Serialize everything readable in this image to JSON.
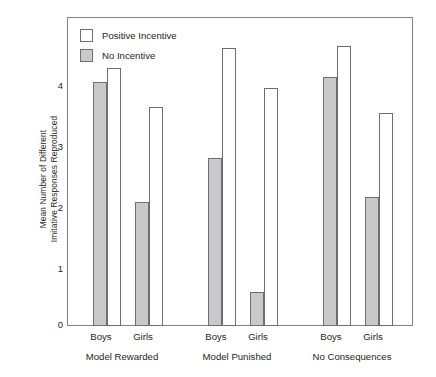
{
  "chart_data": {
    "type": "bar",
    "title": "",
    "subtitle": "",
    "xlabel": "",
    "ylabel_lines": [
      "Mean Number of Different",
      "Imitative Responses Reproduced"
    ],
    "ylabel": "Mean Number of Different Imitative Responses Reproduced",
    "ylim": [
      0,
      4.55
    ],
    "yticks": [
      0,
      1,
      2,
      3,
      4
    ],
    "ytick_labels": [
      "0",
      "1",
      "2",
      "3",
      "4"
    ],
    "grid": false,
    "legend_position": "top-left",
    "legend": [
      {
        "name": "Positive Incentive",
        "swatch": "hollow",
        "color": "#ffffff"
      },
      {
        "name": "No Incentive",
        "swatch": "filled",
        "color": "#c9c9c9"
      }
    ],
    "groups": [
      "Model Rewarded",
      "Model Punished",
      "No Consequences"
    ],
    "subgroups": [
      "Boys",
      "Girls"
    ],
    "categories": [
      "Model Rewarded / Boys",
      "Model Rewarded / Girls",
      "Model Punished / Boys",
      "Model Punished / Girls",
      "No Consequences / Boys",
      "No Consequences / Girls"
    ],
    "series": [
      {
        "name": "No Incentive",
        "swatch": "filled",
        "values": [
          3.6,
          1.83,
          2.48,
          0.5,
          3.66,
          1.9
        ]
      },
      {
        "name": "Positive Incentive",
        "swatch": "hollow",
        "values": [
          3.8,
          3.22,
          4.1,
          3.5,
          4.12,
          3.13
        ]
      }
    ],
    "bars": [
      {
        "group": "Model Rewarded",
        "subgroup": "Boys",
        "series": "No Incentive",
        "value": 3.6,
        "style": "filled"
      },
      {
        "group": "Model Rewarded",
        "subgroup": "Boys",
        "series": "Positive Incentive",
        "value": 3.8,
        "style": "hollow"
      },
      {
        "group": "Model Rewarded",
        "subgroup": "Girls",
        "series": "No Incentive",
        "value": 1.83,
        "style": "filled"
      },
      {
        "group": "Model Rewarded",
        "subgroup": "Girls",
        "series": "Positive Incentive",
        "value": 3.22,
        "style": "hollow"
      },
      {
        "group": "Model Punished",
        "subgroup": "Boys",
        "series": "No Incentive",
        "value": 2.48,
        "style": "filled"
      },
      {
        "group": "Model Punished",
        "subgroup": "Boys",
        "series": "Positive Incentive",
        "value": 4.1,
        "style": "hollow"
      },
      {
        "group": "Model Punished",
        "subgroup": "Girls",
        "series": "No Incentive",
        "value": 0.5,
        "style": "filled"
      },
      {
        "group": "Model Punished",
        "subgroup": "Girls",
        "series": "Positive Incentive",
        "value": 3.5,
        "style": "hollow"
      },
      {
        "group": "No Consequences",
        "subgroup": "Boys",
        "series": "No Incentive",
        "value": 3.66,
        "style": "filled"
      },
      {
        "group": "No Consequences",
        "subgroup": "Boys",
        "series": "Positive Incentive",
        "value": 4.12,
        "style": "hollow"
      },
      {
        "group": "No Consequences",
        "subgroup": "Girls",
        "series": "No Incentive",
        "value": 1.9,
        "style": "filled"
      },
      {
        "group": "No Consequences",
        "subgroup": "Girls",
        "series": "Positive Incentive",
        "value": 3.13,
        "style": "hollow"
      }
    ],
    "colors": {
      "filled": "#c9c9c9",
      "hollow": "#ffffff",
      "outline": "#6d6e71",
      "frame": "#808285",
      "text": "#231f20"
    }
  },
  "axis": {
    "y_title_line1": "Mean Number of Different",
    "y_title_line2": "Imitative Responses Reproduced",
    "ytick_0": "0",
    "ytick_1": "1",
    "ytick_2": "2",
    "ytick_3": "3",
    "ytick_4": "4"
  },
  "legend": {
    "item0_label": "Positive Incentive",
    "item1_label": "No Incentive"
  },
  "xaxis": {
    "g0_boys": "Boys",
    "g0_girls": "Girls",
    "g0_name": "Model Rewarded",
    "g1_boys": "Boys",
    "g1_girls": "Girls",
    "g1_name": "Model Punished",
    "g2_boys": "Boys",
    "g2_girls": "Girls",
    "g2_name": "No Consequences"
  }
}
